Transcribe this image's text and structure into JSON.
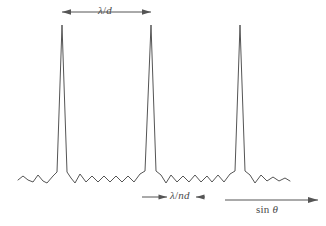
{
  "figure": {
    "type": "diffraction-grating-intensity-plot",
    "background_color": "#ffffff",
    "line_color": "#555555",
    "line_width": 1
  },
  "labels": {
    "grating_order_spacing": {
      "text": "λ/d",
      "numerator": "λ",
      "separator": "/",
      "denominator": "d",
      "meaning": "principal-maximum-spacing"
    },
    "principal_peak_width": {
      "text": "λ/nd",
      "numerator": "λ",
      "separator": "/",
      "denominator": "nd",
      "meaning": "principal-maximum-width"
    },
    "x_axis": {
      "text": "sin θ",
      "prefix": "sin",
      "symbol": "θ",
      "meaning": "horizontal-axis-variable"
    }
  },
  "annotations": {
    "top_arrow": {
      "name": "lambda-over-d-double-arrow",
      "x_start": 62,
      "x_end": 151,
      "y": 12,
      "style": "double-headed-outward"
    },
    "bottom_center_arrow": {
      "name": "lambda-over-nd-inward-arrows",
      "x_start": 142,
      "x_end": 205,
      "y": 197,
      "style": "double-inward-pointing"
    },
    "axis_arrow": {
      "name": "sin-theta-axis-arrow",
      "x_start": 225,
      "x_end": 318,
      "y": 200,
      "style": "single-headed-right"
    }
  },
  "chart_data": {
    "type": "line",
    "title": "",
    "xlabel": "sin θ",
    "ylabel": "",
    "grid": false,
    "legend": null,
    "xlim": [
      0,
      326
    ],
    "ylim": [
      182,
      25
    ],
    "baseline_y": 182,
    "peak_apex_y": 25,
    "principal_maxima_x": [
      62,
      151,
      240
    ],
    "principal_maxima_spacing_px": 89,
    "principal_maximum_half_width_px": 9,
    "curve_x_start": 18,
    "curve_x_end": 290,
    "secondary_maxima_between_peaks": 5,
    "secondary_maxima_amplitude_px": 7,
    "points": [
      [
        18,
        180
      ],
      [
        23,
        176
      ],
      [
        28,
        180
      ],
      [
        33,
        182
      ],
      [
        38,
        175
      ],
      [
        43,
        181
      ],
      [
        47,
        183
      ],
      [
        53,
        176
      ],
      [
        57,
        172
      ],
      [
        62,
        25
      ],
      [
        67,
        172
      ],
      [
        71,
        178
      ],
      [
        75,
        183
      ],
      [
        80,
        174
      ],
      [
        86,
        182
      ],
      [
        92,
        176
      ],
      [
        98,
        182
      ],
      [
        104,
        176
      ],
      [
        110,
        182
      ],
      [
        116,
        176
      ],
      [
        122,
        182
      ],
      [
        128,
        176
      ],
      [
        134,
        182
      ],
      [
        140,
        174
      ],
      [
        145,
        171
      ],
      [
        151,
        25
      ],
      [
        156,
        171
      ],
      [
        161,
        175
      ],
      [
        166,
        183
      ],
      [
        171,
        175
      ],
      [
        177,
        182
      ],
      [
        183,
        176
      ],
      [
        189,
        182
      ],
      [
        195,
        175
      ],
      [
        201,
        182
      ],
      [
        207,
        176
      ],
      [
        212,
        182
      ],
      [
        218,
        175
      ],
      [
        224,
        182
      ],
      [
        230,
        174
      ],
      [
        235,
        171
      ],
      [
        240,
        25
      ],
      [
        245,
        171
      ],
      [
        250,
        175
      ],
      [
        255,
        183
      ],
      [
        261,
        175
      ],
      [
        267,
        181
      ],
      [
        273,
        177
      ],
      [
        279,
        181
      ],
      [
        285,
        178
      ],
      [
        290,
        181
      ]
    ]
  }
}
